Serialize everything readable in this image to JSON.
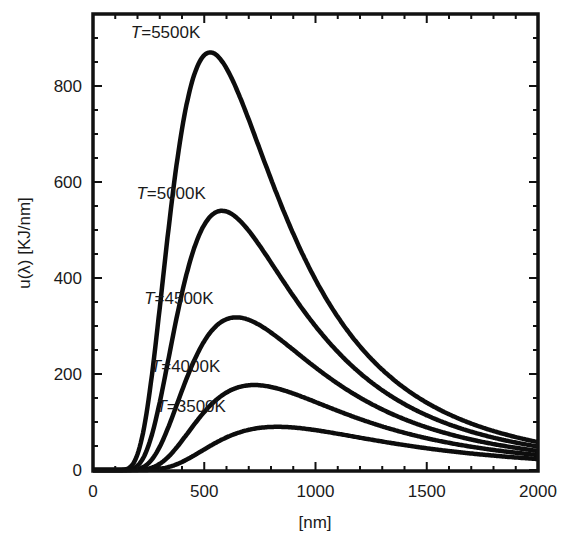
{
  "chart_data": {
    "type": "line",
    "title": "",
    "xlabel": "[nm]",
    "ylabel": "u(λ) [KJ/nm]",
    "xlim": [
      0,
      2000
    ],
    "ylim": [
      0,
      940
    ],
    "x_ticks": [
      0,
      500,
      1000,
      1500,
      2000
    ],
    "x_tick_labels": [
      "0",
      "500",
      "1000",
      "1500",
      "2000"
    ],
    "x_minor_step": 100,
    "y_ticks": [
      0,
      200,
      400,
      600,
      800
    ],
    "y_tick_labels": [
      "0",
      "200",
      "400",
      "600",
      "800"
    ],
    "y_minor_step": 50,
    "grid": false,
    "legend": "none (inline curve labels)",
    "x": [
      200,
      400,
      600,
      800,
      1000,
      1500,
      2000
    ],
    "series": [
      {
        "name": "T=5500K",
        "temperature_K": 5500,
        "peak_nm": 527,
        "peak_value": 870,
        "values": [
          33,
          710,
          841,
          608,
          396,
          140,
          58
        ],
        "label_pos_nm": 170,
        "label_pos_y": 900
      },
      {
        "name": "T=5000K",
        "temperature_K": 5000,
        "peak_nm": 580,
        "peak_value": 540,
        "values": [
          12,
          380,
          538,
          420,
          285,
          108,
          46
        ],
        "label_pos_nm": 195,
        "label_pos_y": 565
      },
      {
        "name": "T=4500K",
        "temperature_K": 4500,
        "peak_nm": 644,
        "peak_value": 318,
        "values": [
          3,
          178,
          314,
          268,
          193,
          79,
          35
        ],
        "label_pos_nm": 230,
        "label_pos_y": 345
      },
      {
        "name": "T=4000K",
        "temperature_K": 4000,
        "peak_nm": 725,
        "peak_value": 177,
        "values": [
          0.6,
          72,
          165,
          172,
          128,
          58,
          27
        ],
        "label_pos_nm": 260,
        "label_pos_y": 205
      },
      {
        "name": "T=3500K",
        "temperature_K": 3500,
        "peak_nm": 828,
        "peak_value": 90,
        "values": [
          0.1,
          22,
          71,
          89,
          80,
          40,
          20
        ],
        "label_pos_nm": 285,
        "label_pos_y": 120
      }
    ]
  },
  "styles": {
    "curve_color": "#0d0d0d",
    "frame_color": "#111111",
    "background": "#ffffff"
  }
}
